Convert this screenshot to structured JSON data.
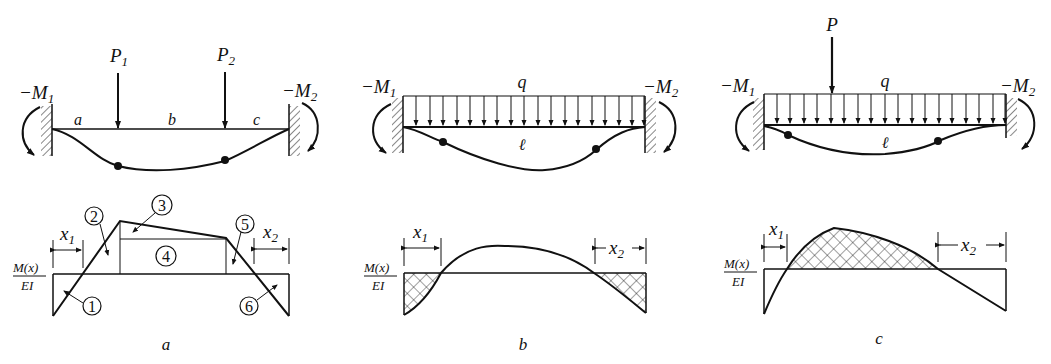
{
  "figure": {
    "panels": [
      {
        "id": "a",
        "caption": "a",
        "beam": {
          "left_moment": "−M",
          "left_moment_sub": "1",
          "right_moment": "−M",
          "right_moment_sub": "2",
          "loads": [
            {
              "label": "P",
              "sub": "1"
            },
            {
              "label": "P",
              "sub": "2"
            }
          ],
          "segments": [
            "a",
            "b",
            "c"
          ]
        },
        "moment_diagram": {
          "ylabel_num": "M(x)",
          "ylabel_den": "EI",
          "x1_label": "x",
          "x1_sub": "1",
          "x2_label": "x",
          "x2_sub": "2",
          "areas": [
            "1",
            "2",
            "3",
            "4",
            "5",
            "6"
          ]
        }
      },
      {
        "id": "b",
        "caption": "b",
        "beam": {
          "left_moment": "−M",
          "left_moment_sub": "1",
          "right_moment": "−M",
          "right_moment_sub": "2",
          "distributed_load": "q",
          "span": "ℓ"
        },
        "moment_diagram": {
          "ylabel_num": "M(x)",
          "ylabel_den": "EI",
          "x1_label": "x",
          "x1_sub": "1",
          "x2_label": "x",
          "x2_sub": "2"
        }
      },
      {
        "id": "c",
        "caption": "c",
        "beam": {
          "left_moment": "−M",
          "left_moment_sub": "1",
          "right_moment": "−M",
          "right_moment_sub": "2",
          "point_load": "P",
          "distributed_load": "q",
          "span": "ℓ"
        },
        "moment_diagram": {
          "ylabel_num": "M(x)",
          "ylabel_den": "EI",
          "x1_label": "x",
          "x1_sub": "1",
          "x2_label": "x",
          "x2_sub": "2"
        }
      }
    ]
  }
}
